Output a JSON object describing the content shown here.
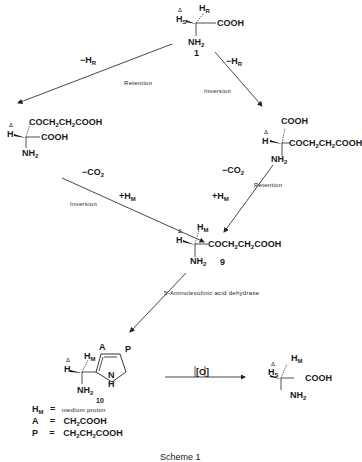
{
  "compounds": {
    "c1": {
      "number": "1",
      "delta": "Δ",
      "h_s": "H",
      "h_s_sub": "S",
      "h_r": "H",
      "h_r_sub": "R",
      "cooh": "COOH",
      "nh2": "NH",
      "nh2_sub": "2"
    },
    "left_intermediate": {
      "delta": "Δ",
      "h": "H",
      "side_chain": "COCH",
      "sc_sub1": "2",
      "sc_mid": "CH",
      "sc_sub2": "2",
      "sc_end": "COOH",
      "cooh": "COOH",
      "nh2": "NH",
      "nh2_sub": "2"
    },
    "right_intermediate": {
      "delta": "Δ",
      "h": "H",
      "cooh": "COOH",
      "side_chain": "COCH",
      "sc_sub1": "2",
      "sc_mid": "CH",
      "sc_sub2": "2",
      "sc_end": "COOH",
      "nh2": "NH",
      "nh2_sub": "2"
    },
    "c9": {
      "number": "9",
      "delta": "Δ",
      "h": "H",
      "h_m": "H",
      "h_m_sub": "M",
      "side_chain": "COCH",
      "sc_sub1": "2",
      "sc_mid": "CH",
      "sc_sub2": "2",
      "sc_end": "COOH",
      "nh2": "NH",
      "nh2_sub": "2"
    },
    "c10": {
      "number": "10",
      "delta": "Δ",
      "h": "H",
      "h_m": "H",
      "h_m_sub": "M",
      "a": "A",
      "p": "P",
      "n": "N",
      "nh_h": "H",
      "nh2": "NH",
      "nh2_sub": "2"
    },
    "product": {
      "delta": "Δ",
      "h_s": "H",
      "h_s_sub": "S",
      "h_m": "H",
      "h_m_sub": "M",
      "cooh": "COOH",
      "nh2": "NH",
      "nh2_sub": "2"
    }
  },
  "arrows": {
    "top_left": {
      "reagent": "−H",
      "reagent_sub": "R",
      "label": "Retention"
    },
    "top_right": {
      "reagent": "−H",
      "reagent_sub": "R",
      "label": "Inversion"
    },
    "mid_left": {
      "reagent1": "−CO",
      "reagent1_sub": "2",
      "reagent2": "+H",
      "reagent2_sub": "M",
      "label": "Inversion"
    },
    "mid_right": {
      "reagent1": "−CO",
      "reagent1_sub": "2",
      "reagent2": "+H",
      "reagent2_sub": "M",
      "label": "Retention"
    },
    "enzyme": {
      "label": "5-Aminolevulinic acid dehydrase"
    },
    "oxidation": {
      "label": "[O]"
    }
  },
  "legend": [
    {
      "symbol": "H",
      "symbol_sub": "M",
      "eq": "=",
      "value": "medium proton"
    },
    {
      "symbol": "A",
      "symbol_sub": "",
      "eq": "=",
      "value": "CH",
      "value_sub": "2",
      "value_end": "COOH"
    },
    {
      "symbol": "P",
      "symbol_sub": "",
      "eq": "=",
      "value": "CH",
      "value_sub": "2",
      "value_mid": "CH",
      "value_sub2": "2",
      "value_end": "COOH"
    }
  ],
  "caption": "Scheme 1"
}
